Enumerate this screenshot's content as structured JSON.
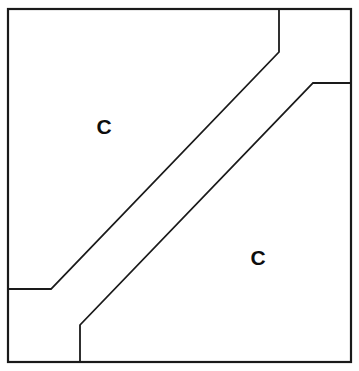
{
  "canvas": {
    "width": 359,
    "height": 371,
    "background_color": "#ffffff"
  },
  "diagram": {
    "title": "",
    "type": "line-drawing",
    "stroke_color": "#1a1a1a",
    "fill_color": "#ffffff",
    "stroke_width": 1.8,
    "frame": {
      "name": "outer-square-frame",
      "left": 8,
      "top": 9,
      "right": 351,
      "bottom": 362,
      "stroke_width": 2.2
    },
    "band": {
      "name": "diagonal-band",
      "orientation": "lower-left-to-upper-right",
      "angle_degrees": 45,
      "upper_edge": {
        "name": "upper-left-band-edge",
        "points": [
          [
            8,
            289
          ],
          [
            51,
            289
          ],
          [
            279,
            52
          ],
          [
            279,
            9
          ]
        ]
      },
      "lower_edge": {
        "name": "lower-right-band-edge",
        "points": [
          [
            80,
            362
          ],
          [
            80,
            325
          ],
          [
            313,
            83
          ],
          [
            351,
            83
          ]
        ]
      }
    },
    "regions": [
      {
        "name": "upper-left-region",
        "label": "C",
        "label_x": 104,
        "label_y": 126
      },
      {
        "name": "lower-right-region",
        "label": "C",
        "label_x": 258,
        "label_y": 257
      }
    ]
  }
}
